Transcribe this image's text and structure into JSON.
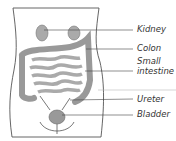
{
  "diagram": {
    "type": "anatomy-urinary-digestive",
    "labels": [
      {
        "id": "kidney",
        "text": "Kidney"
      },
      {
        "id": "colon",
        "text": "Colon"
      },
      {
        "id": "small-intestine-1",
        "text": "Small"
      },
      {
        "id": "small-intestine-2",
        "text": "intestine"
      },
      {
        "id": "ureter",
        "text": "Ureter"
      },
      {
        "id": "bladder",
        "text": "Bladder"
      }
    ],
    "colors": {
      "organ": "#b8b8b8",
      "outline": "#555555",
      "line": "#444444"
    }
  }
}
